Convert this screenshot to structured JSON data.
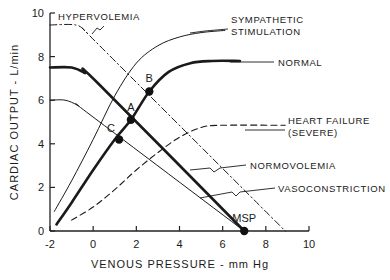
{
  "chart_data": {
    "type": "line",
    "title": "",
    "xlabel": "VENOUS PRESSURE - mm Hg",
    "ylabel": "CARDIAC OUTPUT - L/min",
    "xlim": [
      -2,
      10
    ],
    "ylim": [
      0,
      10
    ],
    "xticks": [
      "-2",
      "0",
      "2",
      "4",
      "6",
      "8",
      "10"
    ],
    "yticks": [
      "0",
      "2",
      "4",
      "6",
      "8",
      "10"
    ],
    "grid": false,
    "series": [
      {
        "name": "SYMPATHETIC STIMULATION",
        "kind": "cardiac-function",
        "style": "thin",
        "points": [
          [
            -1.8,
            0.9
          ],
          [
            -1,
            2.3
          ],
          [
            0,
            4.2
          ],
          [
            1,
            6.2
          ],
          [
            2,
            7.7
          ],
          [
            3,
            8.5
          ],
          [
            4,
            8.9
          ],
          [
            5,
            9.1
          ],
          [
            6.1,
            9.2
          ]
        ]
      },
      {
        "name": "NORMAL",
        "kind": "cardiac-function",
        "style": "bold",
        "points": [
          [
            -1.7,
            0.3
          ],
          [
            -1,
            1.3
          ],
          [
            0,
            2.8
          ],
          [
            1,
            4.2
          ],
          [
            1.75,
            5.1
          ],
          [
            2.6,
            6.4
          ],
          [
            3.5,
            7.3
          ],
          [
            4.5,
            7.7
          ],
          [
            5.5,
            7.8
          ],
          [
            6.8,
            7.8
          ]
        ]
      },
      {
        "name": "HEART FAILURE (SEVERE)",
        "kind": "cardiac-function",
        "style": "dashed",
        "points": [
          [
            -1,
            0.5
          ],
          [
            0,
            1.1
          ],
          [
            1,
            1.9
          ],
          [
            2,
            2.8
          ],
          [
            3,
            3.6
          ],
          [
            4,
            4.3
          ],
          [
            5,
            4.75
          ],
          [
            6,
            4.85
          ],
          [
            8.9,
            4.85
          ]
        ]
      },
      {
        "name": "HYPERVOLEMIA",
        "kind": "venous-return",
        "style": "dashdot",
        "points": [
          [
            -2,
            9.45
          ],
          [
            -0.8,
            9.45
          ],
          [
            -0.3,
            9.1
          ],
          [
            0.3,
            8.5
          ],
          [
            8.9,
            0
          ]
        ]
      },
      {
        "name": "NORMOVOLEMIA",
        "kind": "venous-return",
        "style": "bold",
        "points": [
          [
            -2,
            7.5
          ],
          [
            -1,
            7.5
          ],
          [
            -0.4,
            7.25
          ],
          [
            0.2,
            6.8
          ],
          [
            7,
            0
          ]
        ]
      },
      {
        "name": "VASOCONSTRICTION",
        "kind": "venous-return",
        "style": "thin",
        "points": [
          [
            -2,
            6
          ],
          [
            -1.3,
            6
          ],
          [
            -0.7,
            5.75
          ],
          [
            -0.1,
            5.3
          ],
          [
            7,
            0
          ]
        ]
      }
    ],
    "annotations": [
      {
        "text": "A",
        "x": 1.75,
        "y": 5.1
      },
      {
        "text": "B",
        "x": 2.6,
        "y": 6.4
      },
      {
        "text": "C",
        "x": 1.2,
        "y": 4.2
      },
      {
        "text": "MSP",
        "x": 7,
        "y": 0
      }
    ]
  },
  "labels": {
    "hypervolemia": "HYPERVOLEMIA",
    "sympathetic_1": "SYMPATHETIC",
    "sympathetic_2": "STIMULATION",
    "normal": "NORMAL",
    "heart_failure_1": "HEART FAILURE",
    "heart_failure_2": "(SEVERE)",
    "normovolemia": "NORMOVOLEMIA",
    "vasoconstriction": "VASOCONSTRICTION"
  }
}
